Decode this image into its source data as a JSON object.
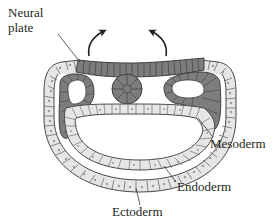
{
  "diagram": {
    "labels": {
      "neural_plate_line1": "Neural",
      "neural_plate_line2": "plate",
      "mesoderm": "Mesoderm",
      "endoderm": "Endoderm",
      "ectoderm": "Ectoderm"
    },
    "arrows": [
      {
        "name": "left-fold-arrow",
        "direction": "up-right"
      },
      {
        "name": "right-fold-arrow",
        "direction": "up-left"
      }
    ],
    "structures": [
      "neural plate",
      "notochord",
      "somites (mesoderm)",
      "endoderm",
      "ectoderm"
    ],
    "colors": {
      "dark_cell": "#7d7d7d",
      "dark_cell_edge": "#3f3f3f",
      "light_cell": "#e8e8e8",
      "light_cell_edge": "#4a4a4a",
      "nucleus": "#9a9a9a",
      "line": "#231f20",
      "background": "#ffffff"
    }
  }
}
